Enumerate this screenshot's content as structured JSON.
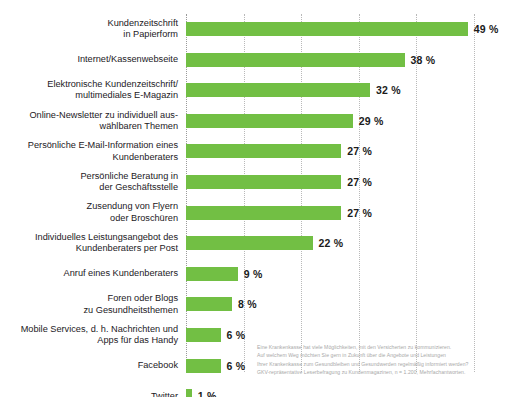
{
  "chart_data": {
    "type": "bar",
    "orientation": "horizontal",
    "title": "",
    "subtitle": "",
    "xlabel": "",
    "ylabel": "",
    "xlim": [
      0,
      50
    ],
    "grid": true,
    "gridlines": [
      0,
      10,
      20,
      30,
      40,
      50
    ],
    "legend": "none",
    "value_suffix": " %",
    "bar_color": "#72BF44",
    "categories": [
      "Kundenzeitschrift in Papierform",
      "Internet/Kassenwebseite",
      "Elektronische Kundenzeitschrift/ multimediales E-Magazin",
      "Online-Newsletter zu individuell auswählbaren Themen",
      "Persönliche E-Mail-Information eines Kundenberaters",
      "Persönliche Beratung in der Geschäftsstelle",
      "Zusendung von Flyern oder Broschüren",
      "Individuelles Leistungsangebot des Kundenberaters per Post",
      "Anruf eines Kundenberaters",
      "Foren oder Blogs zu Gesundheitsthemen",
      "Mobile Services, d. h. Nachrichten und Apps für das Handy",
      "Facebook",
      "Twitter"
    ],
    "values": [
      49,
      38,
      32,
      29,
      27,
      27,
      27,
      22,
      9,
      8,
      6,
      6,
      1
    ],
    "value_labels": [
      "49 %",
      "38 %",
      "32 %",
      "29 %",
      "27 %",
      "27 %",
      "27 %",
      "22 %",
      "9 %",
      "8 %",
      "6 %",
      "6 %",
      "1 %"
    ],
    "rows": [
      {
        "label_lines": [
          "Kundenzeitschrift",
          "in Papierform"
        ],
        "value": 49,
        "value_label": "49 %"
      },
      {
        "label_lines": [
          "Internet/Kassenwebseite"
        ],
        "value": 38,
        "value_label": "38 %"
      },
      {
        "label_lines": [
          "Elektronische Kundenzeitschrift/",
          "multimediales E-Magazin"
        ],
        "value": 32,
        "value_label": "32 %"
      },
      {
        "label_lines": [
          "Online-Newsletter zu individuell aus-",
          "wählbaren Themen"
        ],
        "value": 29,
        "value_label": "29 %"
      },
      {
        "label_lines": [
          "Persönliche E-Mail-Information eines",
          "Kundenberaters"
        ],
        "value": 27,
        "value_label": "27 %"
      },
      {
        "label_lines": [
          "Persönliche Beratung in",
          "der Geschäftsstelle"
        ],
        "value": 27,
        "value_label": "27 %"
      },
      {
        "label_lines": [
          "Zusendung von Flyern",
          "oder Broschüren"
        ],
        "value": 27,
        "value_label": "27 %"
      },
      {
        "label_lines": [
          "Individuelles Leistungsangebot des",
          "Kundenberaters per Post"
        ],
        "value": 22,
        "value_label": "22 %"
      },
      {
        "label_lines": [
          "Anruf eines Kundenberaters"
        ],
        "value": 9,
        "value_label": "9 %"
      },
      {
        "label_lines": [
          "Foren oder Blogs",
          "zu Gesundheitsthemen"
        ],
        "value": 8,
        "value_label": "8 %"
      },
      {
        "label_lines": [
          "Mobile Services, d. h. Nachrichten und",
          "Apps für das Handy"
        ],
        "value": 6,
        "value_label": "6 %"
      },
      {
        "label_lines": [
          "Facebook"
        ],
        "value": 6,
        "value_label": "6 %"
      },
      {
        "label_lines": [
          "Twitter"
        ],
        "value": 1,
        "value_label": "1 %"
      }
    ]
  },
  "footnote": {
    "lines": [
      "Eine Krankenkasse hat viele Möglichkeiten, mit den Versicherten zu kommunizieren.",
      "Auf welchem Weg möchten Sie gern in Zukunft über die Angebote und Leistungen",
      "Ihrer Krankenkasse zum Gesundbleiben und Gesundwerden regelmäßig informiert werden?",
      "GKV-repräsentative Leserbefragung zu Kundenmagazinen, n = 1.200, Mehrfachantworten."
    ]
  }
}
